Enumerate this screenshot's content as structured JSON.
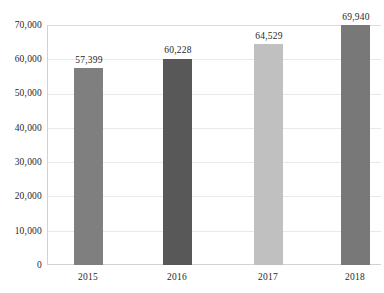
{
  "chart_data": {
    "type": "bar",
    "title": "",
    "subtitle": "",
    "xlabel": "",
    "ylabel": "",
    "categories": [
      "2015",
      "2016",
      "2017",
      "2018"
    ],
    "values": [
      57399,
      60228,
      64529,
      69940
    ],
    "value_labels": [
      "57,399",
      "60,228",
      "64,529",
      "69,940"
    ],
    "bar_colors": [
      "#7f7f7f",
      "#585858",
      "#c0c0c0",
      "#787878"
    ],
    "ylim": [
      0,
      70000
    ],
    "ytick_values": [
      0,
      10000,
      20000,
      30000,
      40000,
      50000,
      60000,
      70000
    ],
    "ytick_labels": [
      "0",
      "10,000",
      "20,000",
      "30,000",
      "40,000",
      "50,000",
      "60,000",
      "70,000"
    ],
    "grid": true,
    "grid_color": "#e9e9e9",
    "legend": null,
    "legend_position": "none",
    "background_color": "#ffffff",
    "text_color": "#1f1f1f",
    "data_labels_shown": true
  }
}
